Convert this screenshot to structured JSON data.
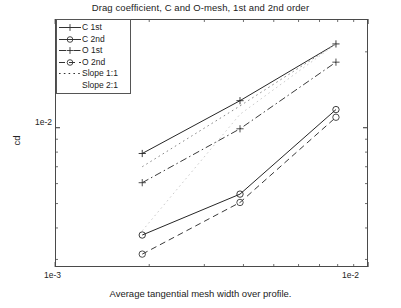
{
  "chart_data": {
    "type": "line",
    "title": "Drag coefficient, C and O-mesh, 1st and 2nd order",
    "xlabel": "Average tangential mesh width over profile.",
    "ylabel": "cd",
    "xscale": "log",
    "yscale": "log",
    "xlim": [
      0.001,
      0.01
    ],
    "ylim": [
      0.0028,
      0.027
    ],
    "xtick_labels": [
      "1e-3",
      "1e-2"
    ],
    "ytick_labels": [
      "1e-2"
    ],
    "grid": false,
    "legend_position": "upper-left-inside",
    "x": [
      0.0019,
      0.0039,
      0.0079
    ],
    "series": [
      {
        "name": "C 1st",
        "marker": "plus",
        "linestyle": "solid",
        "color": "#262626",
        "values": [
          0.0079,
          0.0128,
          0.0215
        ]
      },
      {
        "name": "C 2nd",
        "marker": "circle",
        "linestyle": "solid",
        "color": "#262626",
        "values": [
          0.00375,
          0.00545,
          0.0118
        ]
      },
      {
        "name": "O 1st",
        "marker": "plus",
        "linestyle": "dashdot",
        "color": "#3a3a3a",
        "values": [
          0.00605,
          0.0099,
          0.0182
        ]
      },
      {
        "name": "O 2nd",
        "marker": "circle",
        "linestyle": "dashed",
        "color": "#3a3a3a",
        "values": [
          0.00315,
          0.00505,
          0.011
        ]
      },
      {
        "name": "Slope 1:1",
        "marker": "none",
        "linestyle": "dotted",
        "color": "#8a8a8a",
        "values": [
          0.007,
          0.0122,
          0.0215
        ]
      },
      {
        "name": "Slope 2:1",
        "marker": "none",
        "linestyle": "dotted",
        "color": "#cccccc",
        "values": [
          0.0039,
          0.0113,
          0.0215
        ]
      }
    ],
    "legend_entries": [
      {
        "label": "C 1st",
        "marker": "plus",
        "linestyle": "solid"
      },
      {
        "label": "C 2nd",
        "marker": "circle",
        "linestyle": "solid"
      },
      {
        "label": "O 1st",
        "marker": "plus",
        "linestyle": "dashdot"
      },
      {
        "label": "O 2nd",
        "marker": "circle",
        "linestyle": "dashed"
      },
      {
        "label": "Slope 1:1",
        "marker": "none",
        "linestyle": "dotted"
      },
      {
        "label": "Slope 2:1",
        "marker": "none",
        "linestyle": "none"
      }
    ]
  },
  "figure": {
    "background": "#ffffff",
    "axis_color": "#4a4a4a"
  }
}
